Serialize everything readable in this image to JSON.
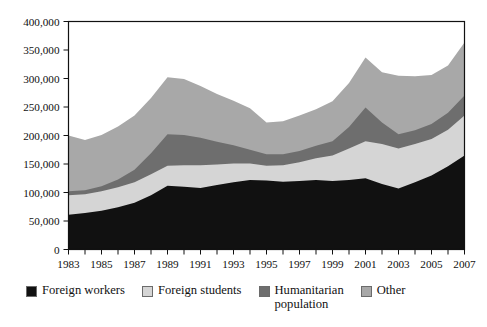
{
  "chart_data": {
    "type": "area",
    "stacked": true,
    "title": "",
    "subtitle": "",
    "xlabel": "",
    "ylabel": "",
    "grid": false,
    "legend_position": "bottom",
    "xlim": [
      1983,
      2007
    ],
    "ylim": [
      0,
      400000
    ],
    "yticks": [
      0,
      50000,
      100000,
      150000,
      200000,
      250000,
      300000,
      350000,
      400000
    ],
    "ytick_labels": [
      "0",
      "50,000",
      "100,000",
      "150,000",
      "200,000",
      "250,000",
      "300,000",
      "350,000",
      "400,000"
    ],
    "x": [
      1983,
      1984,
      1985,
      1986,
      1987,
      1988,
      1989,
      1990,
      1991,
      1992,
      1993,
      1994,
      1995,
      1996,
      1997,
      1998,
      1999,
      2000,
      2001,
      2002,
      2003,
      2004,
      2005,
      2006,
      2007
    ],
    "xtick_labels": [
      "1983",
      "1985",
      "1987",
      "1989",
      "1991",
      "1993",
      "1995",
      "1997",
      "1999",
      "2001",
      "2003",
      "2005",
      "2007"
    ],
    "xticks_labeled": [
      1983,
      1985,
      1987,
      1989,
      1991,
      1993,
      1995,
      1997,
      1999,
      2001,
      2003,
      2005,
      2007
    ],
    "series": [
      {
        "name": "Foreign workers",
        "color": "#111111",
        "values": [
          61000,
          64000,
          68000,
          74000,
          82000,
          95000,
          112000,
          110000,
          108000,
          113000,
          118000,
          122000,
          121000,
          119000,
          120000,
          122000,
          120000,
          122000,
          125000,
          115000,
          107000,
          118000,
          130000,
          146000,
          165000
        ]
      },
      {
        "name": "Foreign students",
        "color": "#d5d5d5",
        "values": [
          34000,
          33000,
          34000,
          35000,
          36000,
          37000,
          35000,
          38000,
          40000,
          36000,
          33000,
          29000,
          26000,
          29000,
          33000,
          38000,
          45000,
          55000,
          65000,
          70000,
          70000,
          67000,
          64000,
          64000,
          70000
        ]
      },
      {
        "name": "Humanitarian population",
        "color": "#6e6e6e",
        "values": [
          7000,
          7000,
          9000,
          14000,
          22000,
          37000,
          55000,
          53000,
          48000,
          40000,
          32000,
          24000,
          20000,
          19000,
          20000,
          22000,
          25000,
          38000,
          59000,
          38000,
          25000,
          24000,
          26000,
          30000,
          35000
        ]
      },
      {
        "name": "Other",
        "color": "#a8a8a8",
        "values": [
          98000,
          88000,
          90000,
          93000,
          95000,
          97000,
          100000,
          98000,
          91000,
          84000,
          78000,
          73000,
          56000,
          58000,
          62000,
          64000,
          70000,
          77000,
          88000,
          88000,
          103000,
          95000,
          86000,
          83000,
          93000
        ]
      }
    ],
    "totals": [
      200000,
      192000,
      201000,
      216000,
      235000,
      266000,
      302000,
      299000,
      287000,
      273000,
      261000,
      248000,
      223000,
      225000,
      235000,
      246000,
      260000,
      292000,
      337000,
      311000,
      305000,
      304000,
      306000,
      323000,
      363000
    ]
  },
  "legend": {
    "items": [
      {
        "label": "Foreign workers",
        "color": "#111111"
      },
      {
        "label": "Foreign students",
        "color": "#d5d5d5"
      },
      {
        "label": "Humanitarian\npopulation",
        "color": "#6e6e6e"
      },
      {
        "label": "Other",
        "color": "#a8a8a8"
      }
    ]
  },
  "axis_colors": {
    "frame": "#111111",
    "tick": "#111111"
  }
}
